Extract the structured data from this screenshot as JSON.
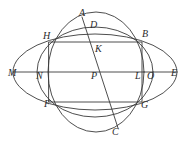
{
  "figure": {
    "stroke_color": "#3a3a3a",
    "background_color": "#ffffff",
    "label_color": "#2b2b2b",
    "width": 191,
    "height": 148,
    "labels": [
      {
        "id": "A",
        "text": "A",
        "x": 79,
        "y": 8
      },
      {
        "id": "D",
        "text": "D",
        "x": 90,
        "y": 20
      },
      {
        "id": "B",
        "text": "B",
        "x": 142,
        "y": 29
      },
      {
        "id": "H",
        "text": "H",
        "x": 43,
        "y": 31
      },
      {
        "id": "K",
        "text": "K",
        "x": 95,
        "y": 44
      },
      {
        "id": "M",
        "text": "M",
        "x": 8,
        "y": 68
      },
      {
        "id": "N",
        "text": "N",
        "x": 36,
        "y": 71
      },
      {
        "id": "P",
        "text": "P",
        "x": 91,
        "y": 71
      },
      {
        "id": "L",
        "text": "L",
        "x": 135,
        "y": 71
      },
      {
        "id": "O",
        "text": "O",
        "x": 147,
        "y": 71
      },
      {
        "id": "E",
        "text": "E",
        "x": 171,
        "y": 68
      },
      {
        "id": "F",
        "text": "F",
        "x": 44,
        "y": 99
      },
      {
        "id": "G",
        "text": "G",
        "x": 141,
        "y": 100
      },
      {
        "id": "C",
        "text": "C",
        "x": 112,
        "y": 127
      }
    ],
    "shapes": {
      "outer_ellipse": {
        "type": "ellipse",
        "cx": 95,
        "cy": 72,
        "rx": 82,
        "ry": 38
      },
      "left_circle": {
        "type": "circle",
        "cx": 96,
        "cy": 72,
        "rx": 48,
        "ry": 60
      },
      "right_circle": {
        "type": "circle",
        "cx": 95,
        "cy": 72,
        "rx": 58,
        "ry": 45
      },
      "rectangle": {
        "type": "rect",
        "x1": 49,
        "y1": 42,
        "x2": 142,
        "y2": 102
      },
      "diameter_ME": {
        "type": "segment",
        "x1": 13,
        "y1": 72,
        "x2": 176,
        "y2": 72
      },
      "chord_AC": {
        "type": "segment",
        "x1": 82,
        "y1": 17,
        "x2": 118,
        "y2": 128
      }
    }
  }
}
